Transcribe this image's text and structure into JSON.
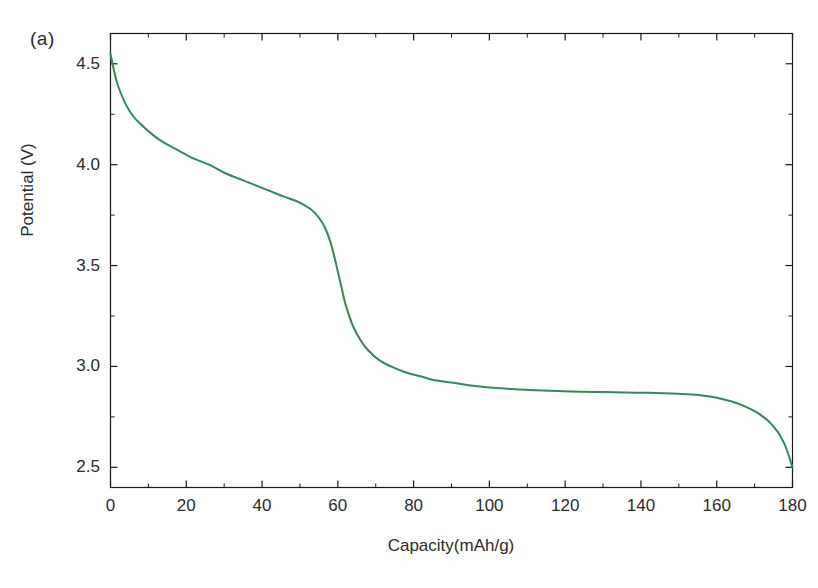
{
  "figure": {
    "panel_label": "(a)",
    "background_color": "#ffffff",
    "axis_color": "#1a1a1a"
  },
  "chart_data": {
    "type": "line",
    "title": "",
    "subtitle": "",
    "panel": "(a)",
    "xlabel": "Capacity(mAh/g)",
    "ylabel": "Potential (V)",
    "xlim": [
      0,
      180
    ],
    "ylim": [
      2.4,
      4.65
    ],
    "xticks": [
      0,
      20,
      40,
      60,
      80,
      100,
      120,
      140,
      160,
      180
    ],
    "yticks": [
      2.5,
      3.0,
      3.5,
      4.0,
      4.5
    ],
    "xtick_labels": [
      "0",
      "20",
      "40",
      "60",
      "80",
      "100",
      "120",
      "140",
      "160",
      "180"
    ],
    "ytick_labels": [
      "2.5",
      "3.0",
      "3.5",
      "4.0",
      "4.5"
    ],
    "x_minor_tick_step": 10,
    "y_minor_tick_step": 0.25,
    "grid": false,
    "legend": null,
    "annotations": [],
    "series": [
      {
        "name": "discharge curve",
        "color": "#2E8B57",
        "line_width": 2,
        "x": [
          0,
          1,
          2,
          4,
          6,
          8,
          11,
          14,
          18,
          22,
          26,
          30,
          34,
          38,
          42,
          46,
          49,
          52,
          54,
          56,
          57,
          58,
          59,
          60,
          61,
          62,
          64,
          66,
          68,
          71,
          74,
          78,
          82,
          86,
          90,
          95,
          100,
          106,
          112,
          118,
          124,
          130,
          136,
          142,
          148,
          152,
          156,
          160,
          164,
          167,
          170,
          172,
          174,
          176,
          177,
          178,
          179,
          180
        ],
        "y": [
          4.55,
          4.46,
          4.39,
          4.3,
          4.24,
          4.2,
          4.15,
          4.11,
          4.07,
          4.03,
          4.0,
          3.96,
          3.93,
          3.9,
          3.87,
          3.84,
          3.82,
          3.79,
          3.76,
          3.71,
          3.67,
          3.62,
          3.55,
          3.47,
          3.39,
          3.31,
          3.2,
          3.13,
          3.08,
          3.03,
          3.0,
          2.97,
          2.95,
          2.93,
          2.92,
          2.905,
          2.895,
          2.888,
          2.882,
          2.878,
          2.875,
          2.873,
          2.871,
          2.869,
          2.866,
          2.862,
          2.856,
          2.845,
          2.826,
          2.806,
          2.778,
          2.754,
          2.723,
          2.678,
          2.648,
          2.61,
          2.56,
          2.5
        ]
      }
    ]
  }
}
